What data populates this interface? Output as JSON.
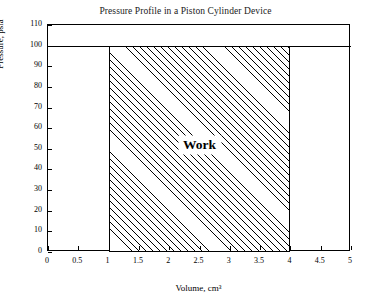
{
  "chart_data": {
    "type": "area",
    "title": "Pressure Profile in a Piston Cylinder Device",
    "xlabel": "Volume, cm³",
    "ylabel": "Pressure, psia",
    "xlim": [
      0,
      5
    ],
    "ylim": [
      0,
      110
    ],
    "grid": false,
    "legend": null,
    "xticks": [
      "0",
      "0.5",
      "1",
      "1.5",
      "2",
      "2.5",
      "3",
      "3.5",
      "4",
      "4.5",
      "5"
    ],
    "xtick_values": [
      0,
      0.5,
      1,
      1.5,
      2,
      2.5,
      3,
      3.5,
      4,
      4.5,
      5
    ],
    "yticks": [
      "0",
      "10",
      "20",
      "30",
      "40",
      "50",
      "60",
      "70",
      "80",
      "90",
      "100",
      "110"
    ],
    "ytick_values": [
      0,
      10,
      20,
      30,
      40,
      50,
      60,
      70,
      80,
      90,
      100,
      110
    ],
    "series": [
      {
        "name": "Pressure",
        "x": [
          1,
          4
        ],
        "y": [
          100,
          100
        ]
      }
    ],
    "shaded_region": {
      "label": "Work",
      "x_start": 1,
      "x_end": 4,
      "y_bottom": 0,
      "y_top": 100,
      "fill": "diagonal-hatch",
      "edge_color": "#000000"
    },
    "annotations": [
      {
        "text": "Work",
        "x": 2.5,
        "y": 52
      }
    ]
  }
}
